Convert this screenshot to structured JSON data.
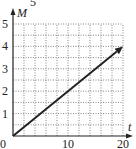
{
  "chart_data": {
    "type": "line",
    "title": "",
    "xlabel": "t",
    "ylabel": "M",
    "xlim": [
      0,
      20
    ],
    "ylim": [
      0,
      5
    ],
    "x_ticks": [
      "0",
      "10",
      "20"
    ],
    "y_ticks": [
      "1",
      "2",
      "3",
      "4",
      "5"
    ],
    "origin_label": "0",
    "grid": true,
    "grid_style": "dotted",
    "grid_x_step": 2,
    "grid_y_step": 0.5,
    "series": [
      {
        "name": "M(t)",
        "x": [
          0,
          20
        ],
        "y": [
          0,
          4
        ],
        "arrow_end": true
      }
    ],
    "top_fragment": "5"
  }
}
